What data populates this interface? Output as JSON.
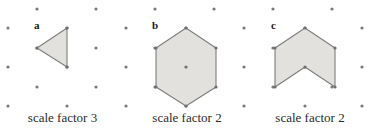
{
  "figure": {
    "width": 371,
    "height": 134,
    "background_color": "#ffffff",
    "dot_color": "#7a7a7a",
    "shape_fill_color": "#e2e1dd",
    "shape_stroke_color": "#7d7d7d",
    "text_color": "#2b2b2b"
  },
  "lattice": {
    "description": "isometric dot grid",
    "column_spacing": 29.5,
    "row_spacing": 19.5,
    "dot_radius": 1.6,
    "dots": [
      [
        37,
        9
      ],
      [
        96,
        9
      ],
      [
        155,
        9
      ],
      [
        214,
        9
      ],
      [
        273,
        9
      ],
      [
        332,
        9
      ],
      [
        8,
        28
      ],
      [
        67,
        28
      ],
      [
        126,
        28
      ],
      [
        186,
        28
      ],
      [
        244,
        28
      ],
      [
        305,
        28
      ],
      [
        362,
        28
      ],
      [
        37,
        48
      ],
      [
        96,
        48
      ],
      [
        155,
        48
      ],
      [
        214,
        48
      ],
      [
        273,
        48
      ],
      [
        332,
        48
      ],
      [
        8,
        67
      ],
      [
        67,
        67
      ],
      [
        126,
        67
      ],
      [
        186,
        67
      ],
      [
        244,
        67
      ],
      [
        305,
        67
      ],
      [
        362,
        67
      ],
      [
        37,
        87
      ],
      [
        96,
        87
      ],
      [
        155,
        87
      ],
      [
        214,
        87
      ],
      [
        273,
        87
      ],
      [
        332,
        87
      ],
      [
        8,
        106
      ],
      [
        67,
        106
      ],
      [
        126,
        106
      ],
      [
        186,
        106
      ],
      [
        244,
        106
      ],
      [
        305,
        106
      ],
      [
        362,
        106
      ]
    ]
  },
  "shapes": [
    {
      "id": "a",
      "letter": "a",
      "letter_position": [
        34,
        20
      ],
      "kind": "triangle",
      "caption": "scale factor 3",
      "scale_factor": 3,
      "vertices": [
        [
          37,
          48
        ],
        [
          67,
          28
        ],
        [
          67,
          67
        ]
      ],
      "center_dot": null
    },
    {
      "id": "b",
      "letter": "b",
      "letter_position": [
        152,
        20
      ],
      "kind": "hexagon",
      "caption": "scale factor 2",
      "scale_factor": 2,
      "vertices": [
        [
          186,
          28
        ],
        [
          216,
          48
        ],
        [
          216,
          87
        ],
        [
          186,
          106
        ],
        [
          156,
          87
        ],
        [
          156,
          48
        ]
      ],
      "center_dot": [
        186,
        67
      ]
    },
    {
      "id": "c",
      "letter": "c",
      "letter_position": [
        271,
        20
      ],
      "kind": "chevron",
      "caption": "scale factor 2",
      "scale_factor": 2,
      "vertices": [
        [
          305,
          28
        ],
        [
          335,
          48
        ],
        [
          335,
          87
        ],
        [
          305,
          67
        ],
        [
          275,
          87
        ],
        [
          275,
          48
        ]
      ],
      "center_dot": null
    }
  ]
}
